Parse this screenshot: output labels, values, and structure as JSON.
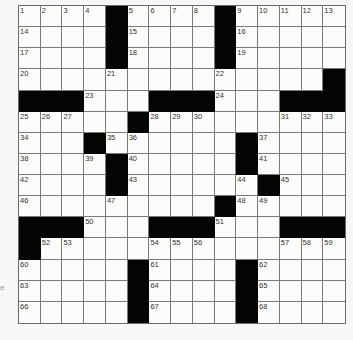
{
  "puzzle": {
    "rows": 15,
    "cols": 15,
    "black_color": "#050505",
    "blocks": [
      [
        0,
        4
      ],
      [
        0,
        9
      ],
      [
        1,
        4
      ],
      [
        1,
        9
      ],
      [
        2,
        4
      ],
      [
        2,
        9
      ],
      [
        3,
        14
      ],
      [
        4,
        0
      ],
      [
        4,
        1
      ],
      [
        4,
        2
      ],
      [
        4,
        6
      ],
      [
        4,
        7
      ],
      [
        4,
        8
      ],
      [
        4,
        12
      ],
      [
        4,
        13
      ],
      [
        4,
        14
      ],
      [
        5,
        5
      ],
      [
        6,
        3
      ],
      [
        6,
        10
      ],
      [
        7,
        4
      ],
      [
        7,
        10
      ],
      [
        8,
        4
      ],
      [
        8,
        11
      ],
      [
        9,
        9
      ],
      [
        10,
        0
      ],
      [
        10,
        1
      ],
      [
        10,
        2
      ],
      [
        10,
        6
      ],
      [
        10,
        7
      ],
      [
        10,
        8
      ],
      [
        10,
        12
      ],
      [
        10,
        13
      ],
      [
        10,
        14
      ],
      [
        11,
        0
      ],
      [
        12,
        5
      ],
      [
        12,
        10
      ],
      [
        13,
        5
      ],
      [
        13,
        10
      ],
      [
        14,
        5
      ],
      [
        14,
        10
      ]
    ],
    "numbers": [
      {
        "r": 0,
        "c": 0,
        "n": "1"
      },
      {
        "r": 0,
        "c": 1,
        "n": "2"
      },
      {
        "r": 0,
        "c": 2,
        "n": "3"
      },
      {
        "r": 0,
        "c": 3,
        "n": "4"
      },
      {
        "r": 0,
        "c": 5,
        "n": "5"
      },
      {
        "r": 0,
        "c": 6,
        "n": "6"
      },
      {
        "r": 0,
        "c": 7,
        "n": "7"
      },
      {
        "r": 0,
        "c": 8,
        "n": "8"
      },
      {
        "r": 0,
        "c": 10,
        "n": "9"
      },
      {
        "r": 0,
        "c": 11,
        "n": "10"
      },
      {
        "r": 0,
        "c": 12,
        "n": "11"
      },
      {
        "r": 0,
        "c": 13,
        "n": "12"
      },
      {
        "r": 0,
        "c": 14,
        "n": "13"
      },
      {
        "r": 1,
        "c": 0,
        "n": "14"
      },
      {
        "r": 1,
        "c": 5,
        "n": "15"
      },
      {
        "r": 1,
        "c": 10,
        "n": "16"
      },
      {
        "r": 2,
        "c": 0,
        "n": "17"
      },
      {
        "r": 2,
        "c": 5,
        "n": "18"
      },
      {
        "r": 2,
        "c": 10,
        "n": "19"
      },
      {
        "r": 3,
        "c": 0,
        "n": "20"
      },
      {
        "r": 3,
        "c": 4,
        "n": "21"
      },
      {
        "r": 3,
        "c": 9,
        "n": "22"
      },
      {
        "r": 4,
        "c": 3,
        "n": "23"
      },
      {
        "r": 4,
        "c": 9,
        "n": "24"
      },
      {
        "r": 5,
        "c": 0,
        "n": "25"
      },
      {
        "r": 5,
        "c": 1,
        "n": "26"
      },
      {
        "r": 5,
        "c": 2,
        "n": "27"
      },
      {
        "r": 5,
        "c": 6,
        "n": "28"
      },
      {
        "r": 5,
        "c": 7,
        "n": "29"
      },
      {
        "r": 5,
        "c": 8,
        "n": "30"
      },
      {
        "r": 5,
        "c": 12,
        "n": "31"
      },
      {
        "r": 5,
        "c": 13,
        "n": "32"
      },
      {
        "r": 5,
        "c": 14,
        "n": "33"
      },
      {
        "r": 6,
        "c": 0,
        "n": "34"
      },
      {
        "r": 6,
        "c": 4,
        "n": "35"
      },
      {
        "r": 6,
        "c": 5,
        "n": "36"
      },
      {
        "r": 6,
        "c": 11,
        "n": "37"
      },
      {
        "r": 7,
        "c": 0,
        "n": "38"
      },
      {
        "r": 7,
        "c": 3,
        "n": "39"
      },
      {
        "r": 7,
        "c": 5,
        "n": "40"
      },
      {
        "r": 7,
        "c": 11,
        "n": "41"
      },
      {
        "r": 8,
        "c": 0,
        "n": "42"
      },
      {
        "r": 8,
        "c": 5,
        "n": "43"
      },
      {
        "r": 8,
        "c": 10,
        "n": "44"
      },
      {
        "r": 8,
        "c": 12,
        "n": "45"
      },
      {
        "r": 9,
        "c": 0,
        "n": "46"
      },
      {
        "r": 9,
        "c": 4,
        "n": "47"
      },
      {
        "r": 9,
        "c": 10,
        "n": "48"
      },
      {
        "r": 9,
        "c": 11,
        "n": "49"
      },
      {
        "r": 10,
        "c": 3,
        "n": "50"
      },
      {
        "r": 10,
        "c": 9,
        "n": "51"
      },
      {
        "r": 11,
        "c": 1,
        "n": "52"
      },
      {
        "r": 11,
        "c": 2,
        "n": "53"
      },
      {
        "r": 11,
        "c": 6,
        "n": "54"
      },
      {
        "r": 11,
        "c": 7,
        "n": "55"
      },
      {
        "r": 11,
        "c": 8,
        "n": "56"
      },
      {
        "r": 11,
        "c": 12,
        "n": "57"
      },
      {
        "r": 11,
        "c": 13,
        "n": "58"
      },
      {
        "r": 11,
        "c": 14,
        "n": "59"
      },
      {
        "r": 12,
        "c": 0,
        "n": "60"
      },
      {
        "r": 12,
        "c": 6,
        "n": "61"
      },
      {
        "r": 12,
        "c": 11,
        "n": "62"
      },
      {
        "r": 13,
        "c": 0,
        "n": "63"
      },
      {
        "r": 13,
        "c": 6,
        "n": "64"
      },
      {
        "r": 13,
        "c": 11,
        "n": "65"
      },
      {
        "r": 14,
        "c": 0,
        "n": "66"
      },
      {
        "r": 14,
        "c": 6,
        "n": "67"
      },
      {
        "r": 14,
        "c": 11,
        "n": "68"
      }
    ]
  },
  "margin_fragment": "e"
}
